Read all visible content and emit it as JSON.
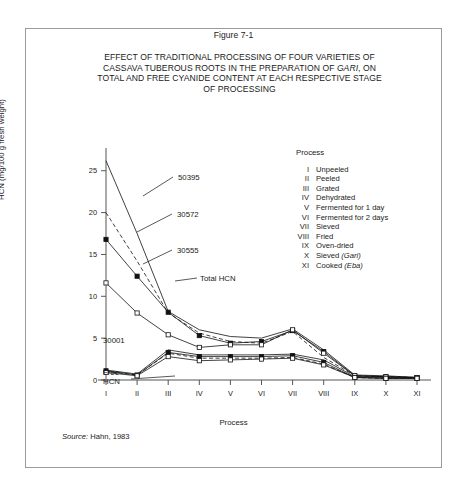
{
  "figure": {
    "number": "Figure 7-1",
    "title_lines": [
      "EFFECT OF TRADITIONAL PROCESSING OF FOUR VARIETIES OF",
      "CASSAVA TUBEROUS ROOTS IN THE PREPARATION OF ",
      "TOTAL AND FREE CYANIDE CONTENT AT EACH RESPECTIVE STAGE",
      "OF PROCESSING"
    ],
    "title_italic_word": "GARI",
    "title_line2_tail": ", ON",
    "source_label": "Source:",
    "source_text": " Hahn, 1983"
  },
  "legend": {
    "heading": "Process",
    "items": [
      {
        "num": "I",
        "label": "Unpeeled",
        "italic": ""
      },
      {
        "num": "II",
        "label": "Peeled",
        "italic": ""
      },
      {
        "num": "III",
        "label": "Grated",
        "italic": ""
      },
      {
        "num": "IV",
        "label": "Dehydrated",
        "italic": ""
      },
      {
        "num": "V",
        "label": "Fermented for 1 day",
        "italic": ""
      },
      {
        "num": "VI",
        "label": "Fermented for 2 days",
        "italic": ""
      },
      {
        "num": "VII",
        "label": "Sieved",
        "italic": ""
      },
      {
        "num": "VIII",
        "label": "Fried",
        "italic": ""
      },
      {
        "num": "IX",
        "label": "Oven-dried",
        "italic": ""
      },
      {
        "num": "X",
        "label": "Sieved ",
        "italic": "(Gari)"
      },
      {
        "num": "XI",
        "label": "Cooked ",
        "italic": "(Eba)"
      }
    ]
  },
  "chart_data": {
    "type": "line",
    "title": "EFFECT OF TRADITIONAL PROCESSING OF FOUR VARIETIES OF CASSAVA TUBEROUS ROOTS IN THE PREPARATION OF GARI, ON TOTAL AND FREE CYANIDE CONTENT AT EACH RESPECTIVE STAGE OF PROCESSING",
    "xlabel": "Process",
    "ylabel": "HCN (mg/100 g fresh weight)",
    "categories": [
      "I",
      "II",
      "III",
      "IV",
      "V",
      "VI",
      "VII",
      "VIII",
      "IX",
      "X",
      "XI"
    ],
    "yticks": [
      0,
      5,
      10,
      15,
      20,
      25
    ],
    "ylim": [
      0,
      27
    ],
    "grid": false,
    "legend_position": "inline-annotations",
    "series": [
      {
        "name": "50395",
        "group": "total",
        "marker": "none",
        "dash": "solid",
        "values": [
          26.2,
          17.5,
          8.2,
          6.0,
          5.2,
          5.0,
          6.1,
          3.6,
          0.6,
          0.5,
          0.3
        ]
      },
      {
        "name": "30572",
        "group": "total",
        "marker": "none",
        "dash": "dashed",
        "values": [
          20.0,
          14.2,
          8.0,
          5.6,
          4.6,
          4.4,
          5.8,
          2.7,
          0.5,
          0.4,
          0.3
        ]
      },
      {
        "name": "30555",
        "group": "total",
        "marker": "filled-square",
        "dash": "solid",
        "values": [
          16.8,
          12.4,
          8.1,
          5.3,
          4.4,
          4.6,
          5.9,
          3.4,
          0.5,
          0.4,
          0.3
        ]
      },
      {
        "name": "30001",
        "group": "total",
        "marker": "open-square",
        "dash": "solid",
        "values": [
          11.6,
          8.0,
          5.4,
          3.9,
          4.2,
          4.2,
          6.0,
          3.2,
          0.5,
          0.4,
          0.3
        ]
      },
      {
        "name": "Free HCN 50395",
        "group": "free",
        "marker": "none",
        "dash": "solid",
        "values": [
          1.2,
          0.7,
          3.6,
          3.0,
          3.0,
          3.0,
          3.1,
          2.4,
          0.4,
          0.3,
          0.2
        ]
      },
      {
        "name": "Free HCN 30572",
        "group": "free",
        "marker": "none",
        "dash": "dashed",
        "values": [
          1.0,
          0.6,
          3.2,
          2.6,
          2.6,
          2.6,
          2.7,
          1.9,
          0.3,
          0.2,
          0.2
        ]
      },
      {
        "name": "Free HCN 30555",
        "group": "free",
        "marker": "filled-square",
        "dash": "solid",
        "values": [
          1.1,
          0.6,
          3.3,
          2.8,
          2.8,
          2.8,
          2.9,
          2.1,
          0.3,
          0.2,
          0.2
        ]
      },
      {
        "name": "Free HCN 30001",
        "group": "free",
        "marker": "open-square",
        "dash": "solid",
        "values": [
          0.9,
          0.5,
          2.8,
          2.3,
          2.4,
          2.5,
          2.6,
          1.8,
          0.3,
          0.2,
          0.2
        ]
      }
    ],
    "annotations": [
      {
        "text": "50395",
        "x": 153,
        "y": 40
      },
      {
        "text": "30572",
        "x": 152,
        "y": 77
      },
      {
        "text": "30555",
        "x": 152,
        "y": 113
      },
      {
        "text": "Total HCN",
        "x": 175,
        "y": 141
      },
      {
        "text": "30001",
        "x": 78,
        "y": 203
      },
      {
        "text": "Free",
        "x": 78,
        "y": 235
      },
      {
        "text": "HCN",
        "x": 78,
        "y": 244
      }
    ]
  }
}
